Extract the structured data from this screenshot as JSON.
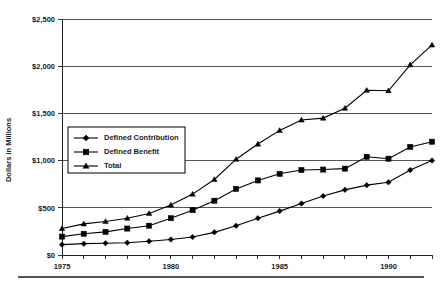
{
  "chart_data": {
    "type": "line",
    "title": "",
    "xlabel": "",
    "ylabel": "Dollars in Millions",
    "xlim": [
      1975,
      1992
    ],
    "ylim": [
      0,
      2500
    ],
    "ytick_values": [
      0,
      500,
      1000,
      1500,
      2000,
      2500
    ],
    "ytick_labels": [
      "$0",
      "$500",
      "$1,000",
      "$1,500",
      "$2,000",
      "$2,500"
    ],
    "xtick_values": [
      1975,
      1976,
      1977,
      1978,
      1979,
      1980,
      1981,
      1982,
      1983,
      1984,
      1985,
      1986,
      1987,
      1988,
      1989,
      1990,
      1991,
      1992
    ],
    "xtick_labels_shown": [
      "1975",
      "1980",
      "1985",
      "1990"
    ],
    "xtick_labeled_values": [
      1975,
      1980,
      1985,
      1990
    ],
    "grid": "horizontal",
    "legend_position": "center-left-inside",
    "x": [
      1975,
      1976,
      1977,
      1978,
      1979,
      1980,
      1981,
      1982,
      1983,
      1984,
      1985,
      1986,
      1987,
      1988,
      1989,
      1990,
      1991,
      1992
    ],
    "series": [
      {
        "name": "Defined Contribution",
        "marker": "diamond",
        "values": [
          110,
          120,
          125,
          130,
          145,
          165,
          190,
          240,
          310,
          390,
          465,
          545,
          625,
          690,
          740,
          770,
          900,
          1000
        ]
      },
      {
        "name": "Defined Benefit",
        "marker": "square",
        "values": [
          195,
          225,
          245,
          280,
          310,
          390,
          475,
          575,
          700,
          790,
          860,
          900,
          905,
          915,
          1040,
          1020,
          1145,
          1200
        ]
      },
      {
        "name": "Total",
        "marker": "triangle",
        "values": [
          280,
          330,
          355,
          390,
          440,
          530,
          645,
          800,
          1015,
          1175,
          1320,
          1430,
          1450,
          1555,
          1745,
          1740,
          2015,
          2225
        ]
      }
    ]
  },
  "legend": {
    "entries": [
      {
        "label": "Defined Contribution",
        "marker": "diamond"
      },
      {
        "label": "Defined Benefit",
        "marker": "square"
      },
      {
        "label": "Total",
        "marker": "triangle"
      }
    ]
  },
  "axes": {
    "y_axis_title": "Dollars in Millions"
  }
}
